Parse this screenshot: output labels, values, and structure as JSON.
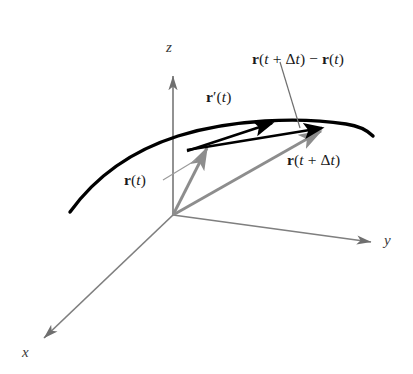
{
  "figure": {
    "background_color": "#ffffff",
    "width": 413,
    "height": 374
  },
  "colors": {
    "curve": "#000000",
    "black_vector": "#000000",
    "gray_vector": "#8d8d8d",
    "axis": "#7f7f7f",
    "leader_line": "#9a9a9a",
    "label_text": "#1a1a1a"
  },
  "axes": [
    {
      "name": "z-axis",
      "label": "z",
      "direction": "up",
      "label_x": 166,
      "label_y": 47
    },
    {
      "name": "y-axis",
      "label": "y",
      "direction": "lower-right",
      "label_x": 384,
      "label_y": 235
    },
    {
      "name": "x-axis",
      "label": "x",
      "direction": "lower-left",
      "label_x": 22,
      "label_y": 345
    }
  ],
  "origin": {
    "x": 173,
    "y": 215,
    "label": ""
  },
  "curve": {
    "name": "space-curve",
    "style": "thick black arc",
    "start": {
      "x": 70,
      "y": 212
    },
    "end": {
      "x": 373,
      "y": 136
    }
  },
  "vectors": [
    {
      "name": "position-vector-t",
      "label_parts": {
        "bold": "r",
        "open": "(",
        "var": "t",
        "close": ")"
      },
      "label_plain": "r(t)",
      "color": "gray",
      "from": {
        "x": 173,
        "y": 215
      },
      "to": {
        "x": 209,
        "y": 144
      },
      "label_x": 125,
      "label_y": 172,
      "has_leader": true
    },
    {
      "name": "position-vector-t-plus-delta-t",
      "label_plain": "r(t + Δt)",
      "color": "gray",
      "from": {
        "x": 173,
        "y": 215
      },
      "to": {
        "x": 326,
        "y": 127
      },
      "label_x": 288,
      "label_y": 152,
      "has_leader": false
    },
    {
      "name": "secant-difference-vector",
      "label_plain": "r(t + Δt) − r(t)",
      "color": "black",
      "from": {
        "x": 208,
        "y": 146
      },
      "to": {
        "x": 329,
        "y": 126
      },
      "label_x": 253,
      "label_y": 52,
      "has_leader": true
    },
    {
      "name": "tangent-derivative-vector",
      "label_plain": "r′(t)",
      "color": "black",
      "from": {
        "x": 188,
        "y": 152
      },
      "to": {
        "x": 280,
        "y": 120
      },
      "label_x": 207,
      "label_y": 90,
      "has_leader": false
    }
  ],
  "labels": {
    "z_axis": "z",
    "y_axis": "y",
    "x_axis": "x",
    "r_of_t": {
      "bold_r": "r",
      "lparen": "(",
      "t": "t",
      "rparen": ")"
    },
    "r_prime_of_t": {
      "bold_r": "r",
      "prime": "′",
      "lparen": "(",
      "t": "t",
      "rparen": ")"
    },
    "r_of_t_plus_dt": {
      "bold_r": "r",
      "lparen": "(",
      "t": "t",
      "plus": " + ",
      "delta": "Δ",
      "t2": "t",
      "rparen": ")"
    },
    "difference": {
      "bold_r1": "r",
      "lparen1": "(",
      "t1": "t",
      "plus": " + ",
      "delta": "Δ",
      "t2": "t",
      "rparen1": ")",
      "minus": " − ",
      "bold_r2": "r",
      "lparen2": "(",
      "t3": "t",
      "rparen2": ")"
    }
  }
}
